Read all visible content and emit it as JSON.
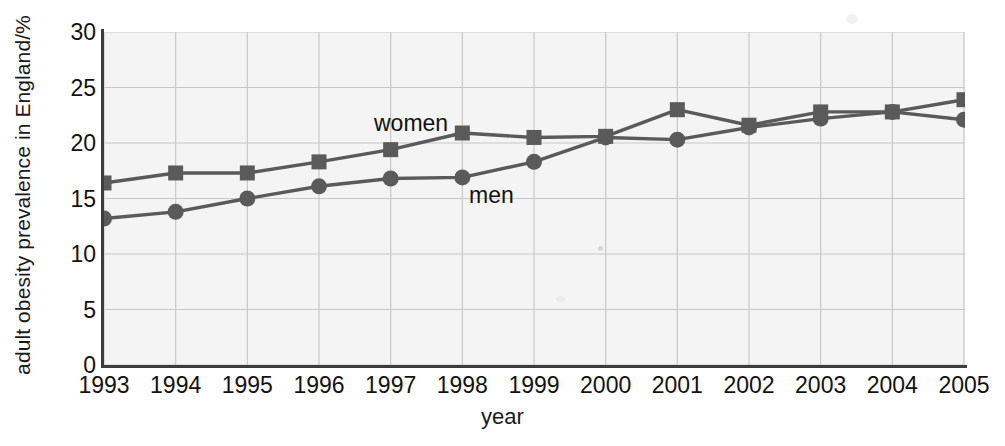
{
  "chart_data": {
    "type": "line",
    "title": "",
    "xlabel": "year",
    "ylabel": "adult obesity prevalence in England/%",
    "categories": [
      "1993",
      "1994",
      "1995",
      "1996",
      "1997",
      "1998",
      "1999",
      "2000",
      "2001",
      "2002",
      "2003",
      "2004",
      "2005"
    ],
    "xlim": [
      1993,
      2005
    ],
    "ylim": [
      0,
      30
    ],
    "yticks": [
      "0",
      "5",
      "10",
      "15",
      "20",
      "25",
      "30"
    ],
    "grid": true,
    "legend_position": "inline-annotations",
    "series": [
      {
        "name": "women",
        "marker": "square",
        "color": "#5a5a5a",
        "values": [
          16.4,
          17.3,
          17.3,
          18.3,
          19.4,
          20.9,
          20.5,
          20.6,
          23.0,
          21.6,
          22.8,
          22.8,
          23.9
        ]
      },
      {
        "name": "men",
        "marker": "circle",
        "color": "#5a5a5a",
        "values": [
          13.2,
          13.8,
          15.0,
          16.1,
          16.8,
          16.9,
          18.3,
          20.5,
          20.3,
          21.4,
          22.2,
          22.8,
          22.1
        ]
      }
    ],
    "annotations": [
      {
        "text": "women",
        "series": "women"
      },
      {
        "text": "men",
        "series": "men"
      }
    ]
  },
  "axes": {
    "y_title": "adult obesity prevalence in England/%",
    "x_title": "year"
  },
  "colors": {
    "plot_background": "#f4f4f4",
    "line": "#5a5a5a",
    "grid": "#c8c8c8",
    "axis": "#3d3d3d",
    "text": "#121212"
  }
}
